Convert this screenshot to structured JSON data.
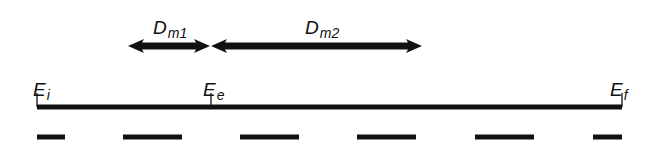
{
  "diagram": {
    "type": "timeline-diagram",
    "colors": {
      "background": "#ffffff",
      "ink": "#111111"
    },
    "timeline": {
      "y": 107,
      "x_start": 37,
      "x_end": 622,
      "thickness": 5
    },
    "ticks": [
      {
        "id": "Ei",
        "x": 37,
        "label": {
          "main": "E",
          "sub": "i"
        },
        "label_x": 33,
        "label_y": 80
      },
      {
        "id": "Ee",
        "x": 211,
        "label": {
          "main": "E",
          "sub": "e"
        },
        "label_x": 203,
        "label_y": 80
      },
      {
        "id": "Ef",
        "x": 622,
        "label": {
          "main": "E",
          "sub": "f"
        },
        "label_x": 610,
        "label_y": 80
      }
    ],
    "arrows": [
      {
        "id": "Dm1",
        "x1": 128,
        "x2": 210,
        "y": 46,
        "label": {
          "main": "D",
          "sub": "m1"
        },
        "label_x": 153,
        "label_y": 18
      },
      {
        "id": "Dm2",
        "x1": 211,
        "x2": 422,
        "y": 46,
        "label": {
          "main": "D",
          "sub": "m2"
        },
        "label_x": 305,
        "label_y": 18
      }
    ],
    "dashes": {
      "y": 137,
      "thickness": 5,
      "segments": [
        [
          37,
          65
        ],
        [
          123,
          182
        ],
        [
          240,
          299
        ],
        [
          357,
          416
        ],
        [
          475,
          534
        ],
        [
          593,
          622
        ]
      ]
    }
  }
}
